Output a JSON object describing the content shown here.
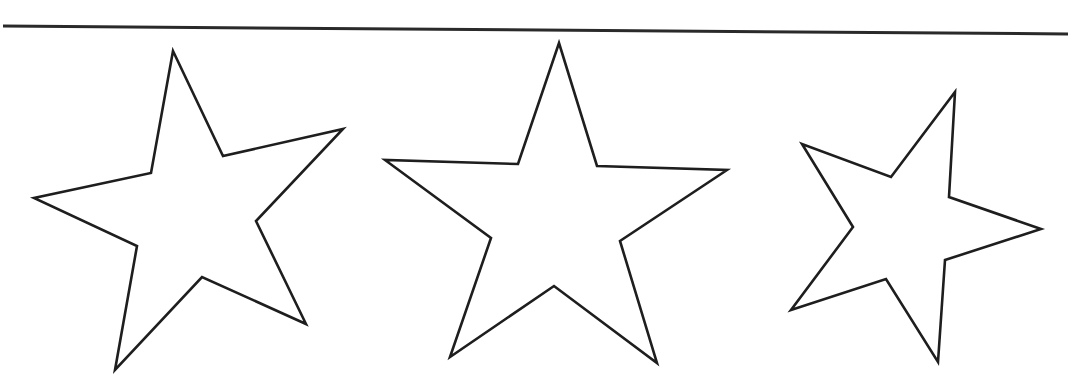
{
  "canvas": {
    "width": 1068,
    "height": 389,
    "background": "#ffffff"
  },
  "rule": {
    "x1": 3,
    "y1": 26,
    "x2": 1068,
    "y2": 34,
    "color": "#2a2a2a"
  },
  "stars": [
    {
      "name": "star-1",
      "points": "173,51 223,156 343,129 256,221 306,324 202,277 115,370 137,246 34,198 151,173"
    },
    {
      "name": "star-2",
      "points": "559,43 597,166 727,170 620,241 657,363 554,286 450,357 491,238 385,160 518,164"
    },
    {
      "name": "star-3",
      "points": "955,92 949,197 1041,229 945,260 938,362 886,279 791,310 853,227 802,144 891,177"
    }
  ],
  "outline_color": "#1e1e1e"
}
